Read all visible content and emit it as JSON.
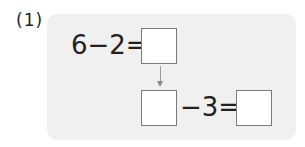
{
  "problem": {
    "number_label": "(1)",
    "row1": {
      "expression": "6−2=",
      "answer_box": ""
    },
    "row2": {
      "left_box": "",
      "expression": "−3=",
      "answer_box": ""
    }
  },
  "colors": {
    "panel_background": "#f0f0f0",
    "box_border": "#7a7a7a",
    "arrow": "#8a8a8a",
    "text": "#231f20"
  }
}
